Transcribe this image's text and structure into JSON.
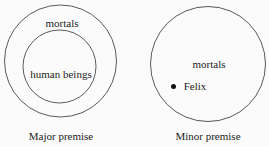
{
  "figure": {
    "colors": {
      "background": "#fbfbfb",
      "stroke": "#5a5a5a",
      "text": "#1c1c1c",
      "point": "#111111"
    },
    "major_premise": {
      "caption": "Major premise",
      "outer_set": {
        "label": "mortals"
      },
      "inner_set": {
        "label": "human beings"
      }
    },
    "minor_premise": {
      "caption": "Minor premise",
      "set": {
        "label": "mortals"
      },
      "element": {
        "label": "Felix",
        "icon": "point-marker"
      }
    }
  }
}
